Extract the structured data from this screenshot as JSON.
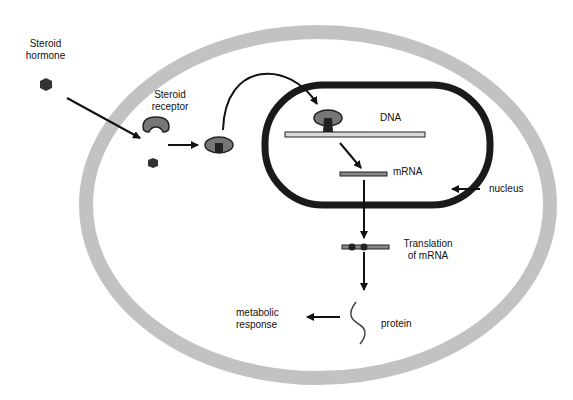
{
  "diagram": {
    "labels": {
      "hormone_line1": "Steroid",
      "hormone_line2": "hormone",
      "receptor_line1": "Steroid",
      "receptor_line2": "receptor",
      "dna": "DNA",
      "mrna": "mRNA",
      "nucleus": "nucleus",
      "translation_line1": "Translation",
      "translation_line2": "of mRNA",
      "metabolic_line1": "metabolic",
      "metabolic_line2": "response",
      "protein": "protein"
    },
    "colors": {
      "cell_membrane": "#bdbdbd",
      "nuclear_envelope": "#1a1a1a",
      "receptor_fill": "#7a7a7a",
      "hormone_fill": "#333333",
      "strand_fill": "#d9d9d9"
    }
  }
}
